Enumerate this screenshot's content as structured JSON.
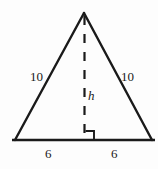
{
  "figure": {
    "name": "isosceles-triangle-with-altitude",
    "background_color": "#fdfdfd",
    "stroke_color": "#1a1a1a",
    "labels": {
      "side_left": "10",
      "side_right": "10",
      "height": "h",
      "base_left": "6",
      "base_right": "6"
    },
    "geometry": {
      "apex": [
        84,
        13
      ],
      "bottom_left": [
        15,
        140
      ],
      "bottom_right": [
        152,
        140
      ],
      "base_line_start": [
        12,
        140
      ],
      "base_line_end": [
        155,
        140
      ],
      "altitude_x": 84.5,
      "altitude_top_y": 15,
      "altitude_bottom_y": 140,
      "right_angle_marker": [
        85,
        131,
        9,
        9
      ]
    }
  }
}
